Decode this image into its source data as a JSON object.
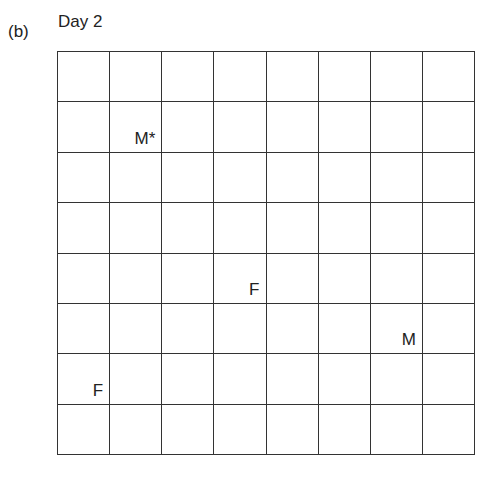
{
  "panel_label": "(b)",
  "title": "Day 2",
  "grid": {
    "rows": 8,
    "cols": 8
  },
  "markers": [
    {
      "label": "M*",
      "row": 1,
      "col": 1,
      "name": "male-star"
    },
    {
      "label": "F",
      "row": 4,
      "col": 3,
      "name": "female"
    },
    {
      "label": "M",
      "row": 5,
      "col": 6,
      "name": "male"
    },
    {
      "label": "F",
      "row": 6,
      "col": 0,
      "name": "female"
    }
  ]
}
